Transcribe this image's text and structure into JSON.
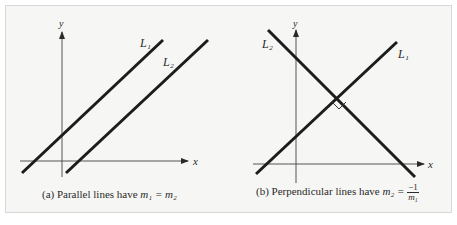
{
  "figure": {
    "panels": [
      {
        "id": "a",
        "caption_prefix": "(a) Parallel lines have ",
        "caption_math": "m₁ = m₂",
        "axis_x_label": "x",
        "axis_y_label": "y",
        "lines": [
          {
            "label": "L₁"
          },
          {
            "label": "L₂"
          }
        ]
      },
      {
        "id": "b",
        "caption_prefix": "(b) Perpendicular lines have ",
        "caption_lhs": "m₂ =",
        "caption_num": "−1",
        "caption_den": "m₁",
        "axis_x_label": "x",
        "axis_y_label": "y",
        "lines": [
          {
            "label": "L₁"
          },
          {
            "label": "L₂"
          }
        ]
      }
    ],
    "colors": {
      "line": "#1c1c1c",
      "axis": "#4a4a4a",
      "background": "#f6f6f4"
    }
  }
}
